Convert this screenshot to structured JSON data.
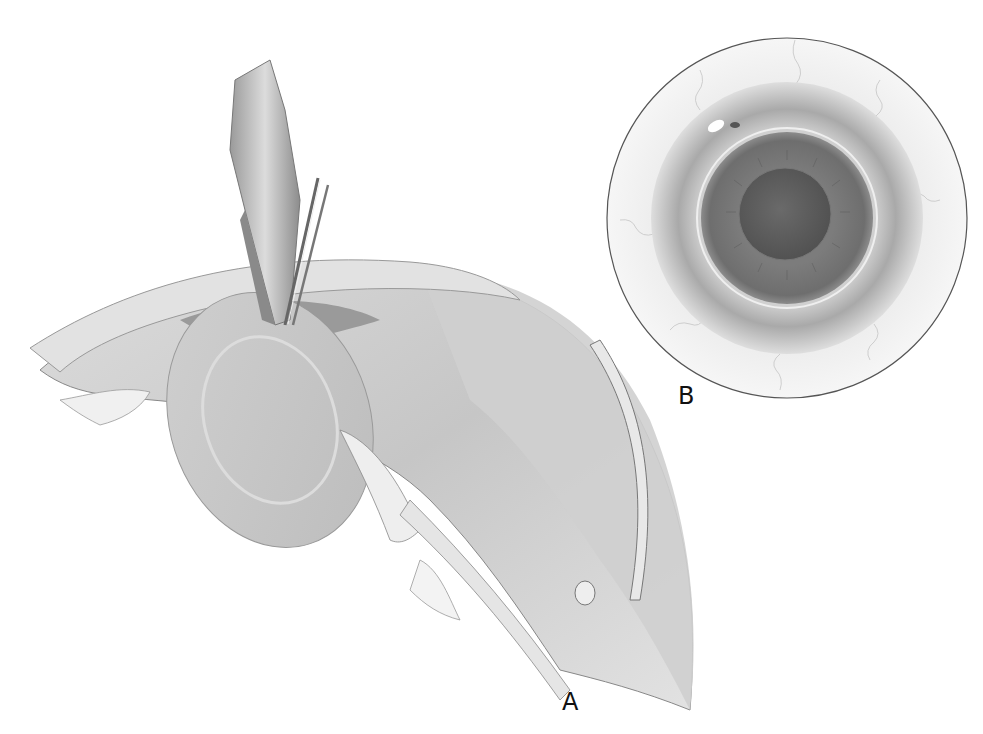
{
  "figure": {
    "panels": [
      {
        "id": "A",
        "label": "A",
        "content": "Cross-section of anterior eye with cornea, iris, lens, ciliary body, sclera, encircling band and surgical instruments"
      },
      {
        "id": "B",
        "label": "B",
        "content": "Frontal view of eye showing sclera, limbus, iris and pupil"
      }
    ],
    "colors": {
      "background": "#ffffff",
      "ink": "#111111",
      "tissue_light": "#e6e6e6",
      "tissue_mid": "#bdbdbd",
      "tissue_dark": "#8a8a8a",
      "iris": "#7a7a7a",
      "pupil": "#5e5e5e"
    }
  }
}
